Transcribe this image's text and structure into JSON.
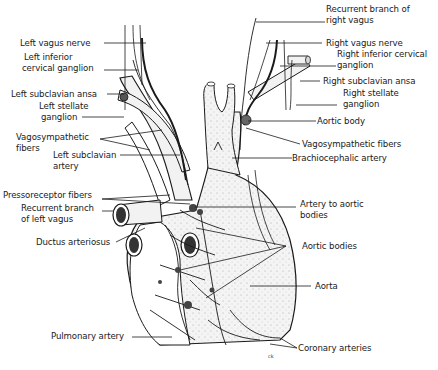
{
  "diagram": {
    "type": "anatomical illustration",
    "colors": {
      "ink": "#1a1a1a",
      "stipple": "#d9d9d9",
      "vessel_fill": "#f2f2f2",
      "background": "#ffffff"
    },
    "labels_left": [
      {
        "id": "left-vagus-nerve",
        "text": "Left vagus nerve"
      },
      {
        "id": "left-inferior-cervical-ganglion",
        "line1": "Left inferior",
        "line2": "cervical ganglion"
      },
      {
        "id": "left-subclavian-ansa",
        "text": "Left subclavian ansa"
      },
      {
        "id": "left-stellate-ganglion",
        "line1": "Left stellate",
        "line2": "ganglion"
      },
      {
        "id": "vagosympathetic-fibers-left",
        "line1": "Vagosympathetic",
        "line2": "fibers"
      },
      {
        "id": "left-subclavian-artery",
        "line1": "Left subclavian",
        "line2": "artery"
      },
      {
        "id": "pressoreceptor-fibers",
        "text": "Pressoreceptor fibers"
      },
      {
        "id": "recurrent-branch-left-vagus",
        "line1": "Recurrent branch",
        "line2": "of left vagus"
      },
      {
        "id": "ductus-arteriosus",
        "text": "Ductus arteriosus"
      },
      {
        "id": "pulmonary-artery",
        "text": "Pulmonary artery"
      }
    ],
    "labels_right": [
      {
        "id": "recurrent-branch-right-vagus",
        "line1": "Recurrent branch of",
        "line2": "right vagus"
      },
      {
        "id": "right-vagus-nerve",
        "text": "Right vagus nerve"
      },
      {
        "id": "right-inferior-cervical-ganglion",
        "line1": "Right inferior cervical",
        "line2": "ganglion"
      },
      {
        "id": "right-subclavian-ansa",
        "text": "Right subclavian ansa"
      },
      {
        "id": "right-stellate-ganglion",
        "line1": "Right stellate",
        "line2": "ganglion"
      },
      {
        "id": "aortic-body",
        "text": "Aortic body"
      },
      {
        "id": "vagosympathetic-fibers-right",
        "text": "Vagosympathetic fibers"
      },
      {
        "id": "brachiocephalic-artery",
        "text": "Brachiocephalic artery"
      },
      {
        "id": "artery-to-aortic-bodies",
        "line1": "Artery to aortic",
        "line2": "bodies"
      },
      {
        "id": "aortic-bodies",
        "text": "Aortic bodies"
      },
      {
        "id": "aorta",
        "text": "Aorta"
      },
      {
        "id": "coronary-arteries",
        "text": "Coronary arteries"
      }
    ],
    "signature": "ck"
  }
}
